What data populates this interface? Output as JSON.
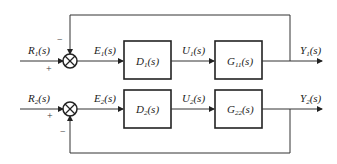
{
  "diagram": {
    "type": "block-diagram",
    "loops": [
      {
        "input": {
          "name": "R",
          "sub": "1",
          "arg": "(s)"
        },
        "error": {
          "name": "E",
          "sub": "1",
          "arg": "(s)"
        },
        "controller": {
          "name": "D",
          "sub": "1",
          "arg": "(s)"
        },
        "control": {
          "name": "U",
          "sub": "1",
          "arg": "(s)"
        },
        "plant": {
          "name": "G",
          "sub": "11",
          "arg": "(s)"
        },
        "output": {
          "name": "Y",
          "sub": "1",
          "arg": "(s)"
        },
        "sum_signs": {
          "input": "+",
          "feedback": "−"
        }
      },
      {
        "input": {
          "name": "R",
          "sub": "2",
          "arg": "(s)"
        },
        "error": {
          "name": "E",
          "sub": "2",
          "arg": "(s)"
        },
        "controller": {
          "name": "D",
          "sub": "2",
          "arg": "(s)"
        },
        "control": {
          "name": "U",
          "sub": "2",
          "arg": "(s)"
        },
        "plant": {
          "name": "G",
          "sub": "22",
          "arg": "(s)"
        },
        "output": {
          "name": "Y",
          "sub": "2",
          "arg": "(s)"
        },
        "sum_signs": {
          "input": "+",
          "feedback": "−"
        }
      }
    ]
  }
}
